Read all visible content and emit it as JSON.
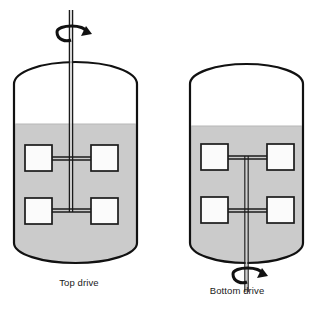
{
  "figure": {
    "units": "px",
    "canvas": {
      "width": 316,
      "height": 312
    },
    "colors": {
      "liquid_fill": "#cbcbcb",
      "outline": "#111111",
      "blade_fill": "#fbfbfb",
      "shaft": "#9a9a9a",
      "background": "#ffffff",
      "caption_text": "#1a1a1a"
    }
  },
  "tanks": [
    {
      "id": "top-drive",
      "caption": "Top drive",
      "drive_position": "top",
      "rotation_arrow": {
        "label": "rotation-arrow",
        "direction": "counterclockwise",
        "position": "above-tank"
      },
      "vessel": {
        "left": 14,
        "right": 137,
        "top": 62,
        "bottom": 263,
        "dome_height": 22,
        "bottom_round": 20
      },
      "liquid_level_y": 124,
      "shaft": {
        "x": 71,
        "top": 10,
        "bottom": 212,
        "width": 4
      },
      "impellers": [
        {
          "level": "upper",
          "center_y": 158,
          "blades": 2
        },
        {
          "level": "lower",
          "center_y": 211,
          "blades": 2
        }
      ],
      "blade_size": {
        "width": 27,
        "height": 25
      }
    },
    {
      "id": "bottom-drive",
      "caption": "Bottom drive",
      "drive_position": "bottom",
      "rotation_arrow": {
        "label": "rotation-arrow",
        "direction": "counterclockwise",
        "position": "below-tank"
      },
      "vessel": {
        "left": 190,
        "right": 303,
        "top": 64,
        "bottom": 263,
        "dome_height": 20,
        "bottom_round": 20
      },
      "liquid_level_y": 126,
      "shaft": {
        "x": 246,
        "top": 156,
        "bottom": 292,
        "width": 4
      },
      "impellers": [
        {
          "level": "upper",
          "center_y": 157,
          "blades": 2
        },
        {
          "level": "lower",
          "center_y": 210,
          "blades": 2
        }
      ],
      "blade_size": {
        "width": 27,
        "height": 25
      }
    }
  ]
}
